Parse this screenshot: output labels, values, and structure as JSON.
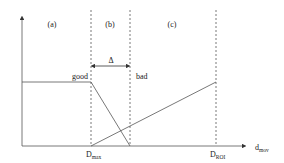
{
  "diagram": {
    "regions": [
      {
        "id": "a",
        "label": "(a)"
      },
      {
        "id": "b",
        "label": "(b)"
      },
      {
        "id": "c",
        "label": "(c)"
      }
    ],
    "curves": {
      "good_label": "good",
      "bad_label": "bad"
    },
    "delta_label": "Δ",
    "x_axis": {
      "label_main": "d",
      "label_sub": "mov",
      "ticks": [
        {
          "main": "D",
          "sub": "max"
        },
        {
          "main": "D",
          "sub": "ROI"
        }
      ]
    },
    "colors": {
      "line": "#555555",
      "dashed": "#555555",
      "text": "#222222"
    }
  }
}
